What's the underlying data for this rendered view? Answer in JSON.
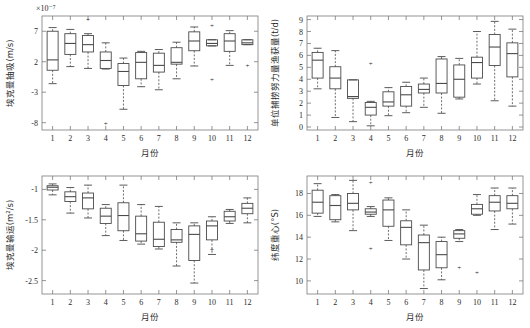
{
  "figure": {
    "panel_count": 4,
    "shared_xlabel": "月份",
    "month_ticks": [
      "1",
      "2",
      "3",
      "4",
      "5",
      "6",
      "7",
      "8",
      "9",
      "10",
      "11",
      "12"
    ]
  },
  "chart_data": [
    {
      "type": "box",
      "id": "ekman-pumping",
      "position": "top-left",
      "title": "",
      "xlabel": "月份",
      "ylabel": "埃克曼抽吸(m/s)",
      "y_exponent_label": "×10⁻⁷",
      "ylim": [
        -9.2,
        9.5
      ],
      "yticks": [
        7,
        2,
        -3,
        -8
      ],
      "ytick_labels": [
        "7",
        "2",
        "-3",
        "-8"
      ],
      "xlim": [
        0.4,
        12.6
      ],
      "grid": false,
      "legend": "none",
      "categories": [
        "1",
        "2",
        "3",
        "4",
        "5",
        "6",
        "7",
        "8",
        "9",
        "10",
        "11",
        "12"
      ],
      "boxes": [
        {
          "category": "1",
          "whislo": -1.6,
          "q1": 0.6,
          "med": 2.3,
          "q3": 7.0,
          "whishi": 7.6,
          "fliers": []
        },
        {
          "category": "2",
          "whislo": 1.2,
          "q1": 3.2,
          "med": 5.0,
          "q3": 6.6,
          "whishi": 7.3,
          "fliers": []
        },
        {
          "category": "3",
          "whislo": 0.9,
          "q1": 3.6,
          "med": 4.8,
          "q3": 6.3,
          "whishi": 6.6,
          "fliers": [
            9.0
          ]
        },
        {
          "category": "4",
          "whislo": 0.8,
          "q1": 0.9,
          "med": 2.2,
          "q3": 3.6,
          "whishi": 5.1,
          "fliers": [
            -8.2
          ]
        },
        {
          "category": "5",
          "whislo": -5.8,
          "q1": -1.9,
          "med": 0.4,
          "q3": 1.7,
          "whishi": 2.6,
          "fliers": []
        },
        {
          "category": "6",
          "whislo": -2.1,
          "q1": -0.8,
          "med": 1.9,
          "q3": 3.5,
          "whishi": 3.7,
          "fliers": []
        },
        {
          "category": "7",
          "whislo": -2.6,
          "q1": 0.3,
          "med": 1.4,
          "q3": 3.4,
          "whishi": 4.0,
          "fliers": []
        },
        {
          "category": "8",
          "whislo": -0.8,
          "q1": 1.6,
          "med": 1.9,
          "q3": 4.3,
          "whishi": 5.2,
          "fliers": []
        },
        {
          "category": "9",
          "whislo": 1.3,
          "q1": 3.8,
          "med": 5.4,
          "q3": 6.9,
          "whishi": 7.7,
          "fliers": []
        },
        {
          "category": "10",
          "whislo": 4.6,
          "q1": 4.6,
          "med": 5.0,
          "q3": 5.6,
          "whishi": 5.6,
          "fliers": [
            8.0,
            -0.9
          ]
        },
        {
          "category": "11",
          "whislo": 1.4,
          "q1": 3.7,
          "med": 5.4,
          "q3": 6.6,
          "whishi": 7.1,
          "fliers": []
        },
        {
          "category": "12",
          "whislo": 4.8,
          "q1": 4.8,
          "med": 5.1,
          "q3": 5.6,
          "whishi": 5.6,
          "fliers": [
            1.3
          ]
        }
      ]
    },
    {
      "type": "box",
      "id": "cpue",
      "position": "top-right",
      "title": "",
      "xlabel": "月份",
      "ylabel": "单位捕捞努力量渔获量(t/d)",
      "y_exponent_label": "",
      "ylim": [
        -0.25,
        9.3
      ],
      "yticks": [
        0,
        1,
        2,
        3,
        4,
        5,
        6,
        7,
        8,
        9
      ],
      "ytick_labels": [
        "0",
        "1",
        "2",
        "3",
        "4",
        "5",
        "6",
        "7",
        "8",
        "9"
      ],
      "xlim": [
        0.4,
        12.6
      ],
      "grid": false,
      "legend": "none",
      "categories": [
        "1",
        "2",
        "3",
        "4",
        "5",
        "6",
        "7",
        "8",
        "9",
        "10",
        "11",
        "12"
      ],
      "boxes": [
        {
          "category": "1",
          "whislo": 3.2,
          "q1": 4.1,
          "med": 5.6,
          "q3": 6.25,
          "whishi": 6.6,
          "fliers": []
        },
        {
          "category": "2",
          "whislo": 0.8,
          "q1": 3.2,
          "med": 4.1,
          "q3": 5.05,
          "whishi": 6.4,
          "fliers": []
        },
        {
          "category": "3",
          "whislo": 0.45,
          "q1": 2.4,
          "med": 2.55,
          "q3": 3.95,
          "whishi": 3.95,
          "fliers": []
        },
        {
          "category": "4",
          "whislo": 0.1,
          "q1": 1.0,
          "med": 1.65,
          "q3": 2.05,
          "whishi": 2.15,
          "fliers": [
            5.35
          ]
        },
        {
          "category": "5",
          "whislo": 0.95,
          "q1": 1.75,
          "med": 2.1,
          "q3": 2.95,
          "whishi": 3.3,
          "fliers": []
        },
        {
          "category": "6",
          "whislo": 1.2,
          "q1": 1.75,
          "med": 2.7,
          "q3": 3.4,
          "whishi": 3.75,
          "fliers": []
        },
        {
          "category": "7",
          "whislo": 1.65,
          "q1": 2.85,
          "med": 3.15,
          "q3": 3.6,
          "whishi": 4.1,
          "fliers": []
        },
        {
          "category": "8",
          "whislo": 1.15,
          "q1": 2.85,
          "med": 3.65,
          "q3": 5.7,
          "whishi": 5.9,
          "fliers": []
        },
        {
          "category": "9",
          "whislo": 2.35,
          "q1": 2.5,
          "med": 4.0,
          "q3": 5.2,
          "whishi": 5.75,
          "fliers": []
        },
        {
          "category": "10",
          "whislo": 3.6,
          "q1": 4.1,
          "med": 5.4,
          "q3": 5.85,
          "whishi": 8.0,
          "fliers": []
        },
        {
          "category": "11",
          "whislo": 2.2,
          "q1": 5.15,
          "med": 6.7,
          "q3": 7.75,
          "whishi": 8.85,
          "fliers": []
        },
        {
          "category": "12",
          "whislo": 1.75,
          "q1": 4.2,
          "med": 6.15,
          "q3": 7.05,
          "whishi": 8.2,
          "fliers": []
        }
      ]
    },
    {
      "type": "box",
      "id": "ekman-transport",
      "position": "bottom-left",
      "title": "",
      "xlabel": "月份",
      "ylabel": "埃克曼输运(m²/s)",
      "y_exponent_label": "",
      "ylim": [
        -2.72,
        -0.78
      ],
      "yticks": [
        -1,
        -1.5,
        -2,
        -2.5
      ],
      "ytick_labels": [
        "-1",
        "-1.5",
        "-2",
        "-2.5"
      ],
      "xlim": [
        0.4,
        12.6
      ],
      "grid": false,
      "legend": "none",
      "categories": [
        "1",
        "2",
        "3",
        "4",
        "5",
        "6",
        "7",
        "8",
        "9",
        "10",
        "11",
        "12"
      ],
      "boxes": [
        {
          "category": "1",
          "whislo": -1.09,
          "q1": -1.01,
          "med": -0.965,
          "q3": -0.94,
          "whishi": -0.91,
          "fliers": []
        },
        {
          "category": "2",
          "whislo": -1.39,
          "q1": -1.2,
          "med": -1.12,
          "q3": -1.04,
          "whishi": -0.97,
          "fliers": []
        },
        {
          "category": "3",
          "whislo": -1.47,
          "q1": -1.32,
          "med": -1.14,
          "q3": -1.06,
          "whishi": -0.93,
          "fliers": []
        },
        {
          "category": "4",
          "whislo": -1.76,
          "q1": -1.56,
          "med": -1.44,
          "q3": -1.31,
          "whishi": -1.25,
          "fliers": []
        },
        {
          "category": "5",
          "whislo": -1.84,
          "q1": -1.68,
          "med": -1.43,
          "q3": -1.22,
          "whishi": -0.93,
          "fliers": []
        },
        {
          "category": "6",
          "whislo": -1.9,
          "q1": -1.85,
          "med": -1.73,
          "q3": -1.44,
          "whishi": -1.25,
          "fliers": []
        },
        {
          "category": "7",
          "whislo": -1.98,
          "q1": -1.94,
          "med": -1.82,
          "q3": -1.54,
          "whishi": -1.28,
          "fliers": []
        },
        {
          "category": "8",
          "whislo": -2.26,
          "q1": -1.87,
          "med": -1.83,
          "q3": -1.66,
          "whishi": -1.55,
          "fliers": []
        },
        {
          "category": "9",
          "whislo": -2.54,
          "q1": -2.17,
          "med": -1.74,
          "q3": -1.6,
          "whishi": -1.55,
          "fliers": []
        },
        {
          "category": "10",
          "whislo": -2.07,
          "q1": -1.83,
          "med": -1.6,
          "q3": -1.52,
          "whishi": -1.45,
          "fliers": [
            -1.99
          ]
        },
        {
          "category": "11",
          "whislo": -1.56,
          "q1": -1.52,
          "med": -1.45,
          "q3": -1.36,
          "whishi": -1.33,
          "fliers": []
        },
        {
          "category": "12",
          "whislo": -1.55,
          "q1": -1.4,
          "med": -1.31,
          "q3": -1.23,
          "whishi": -1.14,
          "fliers": []
        }
      ]
    },
    {
      "type": "box",
      "id": "latitude-gravity-center",
      "position": "bottom-right",
      "title": "",
      "xlabel": "月份",
      "ylabel": "纬度重心(°S)",
      "y_exponent_label": "",
      "ylim": [
        8.8,
        19.6
      ],
      "yticks": [
        10,
        12,
        14,
        16,
        18
      ],
      "ytick_labels": [
        "10",
        "12",
        "14",
        "16",
        "18"
      ],
      "xlim": [
        0.4,
        12.6
      ],
      "grid": false,
      "legend": "none",
      "categories": [
        "1",
        "2",
        "3",
        "4",
        "5",
        "6",
        "7",
        "8",
        "9",
        "10",
        "11",
        "12"
      ],
      "boxes": [
        {
          "category": "1",
          "whislo": 15.9,
          "q1": 16.2,
          "med": 17.2,
          "q3": 18.3,
          "whishi": 18.9,
          "fliers": []
        },
        {
          "category": "2",
          "whislo": 15.4,
          "q1": 15.6,
          "med": 16.9,
          "q3": 17.8,
          "whishi": 17.9,
          "fliers": []
        },
        {
          "category": "3",
          "whislo": 14.6,
          "q1": 16.5,
          "med": 17.1,
          "q3": 18.0,
          "whishi": 19.2,
          "fliers": []
        },
        {
          "category": "4",
          "whislo": 15.9,
          "q1": 16.1,
          "med": 16.3,
          "q3": 16.6,
          "whishi": 16.8,
          "fliers": [
            19.0,
            13.0
          ]
        },
        {
          "category": "5",
          "whislo": 13.7,
          "q1": 15.0,
          "med": 16.5,
          "q3": 17.4,
          "whishi": 17.6,
          "fliers": []
        },
        {
          "category": "6",
          "whislo": 12.0,
          "q1": 13.3,
          "med": 14.9,
          "q3": 15.5,
          "whishi": 16.5,
          "fliers": []
        },
        {
          "category": "7",
          "whislo": 9.3,
          "q1": 11.0,
          "med": 13.5,
          "q3": 14.2,
          "whishi": 15.1,
          "fliers": []
        },
        {
          "category": "8",
          "whislo": 10.1,
          "q1": 11.2,
          "med": 12.4,
          "q3": 13.6,
          "whishi": 14.0,
          "fliers": []
        },
        {
          "category": "9",
          "whislo": 13.6,
          "q1": 13.9,
          "med": 14.3,
          "q3": 14.6,
          "whishi": 14.7,
          "fliers": [
            11.2
          ]
        },
        {
          "category": "10",
          "whislo": 16.0,
          "q1": 16.1,
          "med": 16.6,
          "q3": 17.0,
          "whishi": 17.9,
          "fliers": [
            10.8
          ]
        },
        {
          "category": "11",
          "whislo": 14.7,
          "q1": 16.4,
          "med": 17.2,
          "q3": 17.8,
          "whishi": 18.5,
          "fliers": []
        },
        {
          "category": "12",
          "whislo": 15.2,
          "q1": 16.6,
          "med": 17.1,
          "q3": 17.8,
          "whishi": 18.5,
          "fliers": []
        }
      ]
    }
  ]
}
